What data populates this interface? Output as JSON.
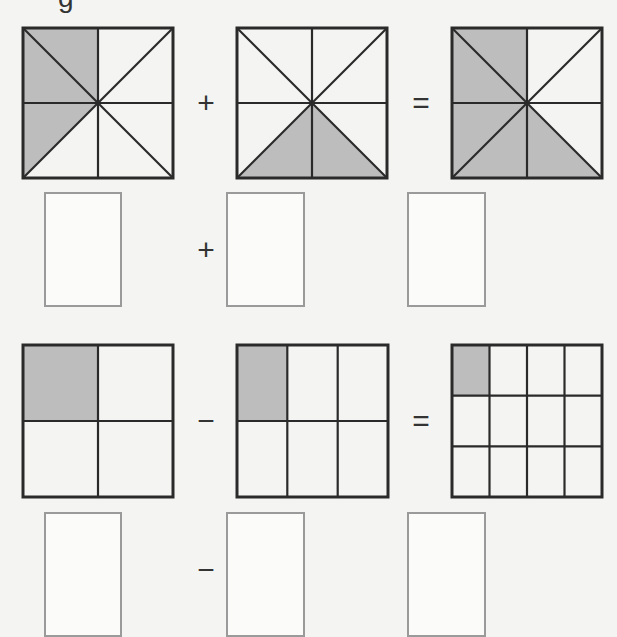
{
  "header": {
    "fragment_text": "g"
  },
  "colors": {
    "shade": "#bdbdbd",
    "line": "#2a2a2a",
    "box_border": "#9a9a9a",
    "background": "#f4f4f2"
  },
  "problems": [
    {
      "type": "addition",
      "operator": "+",
      "equals": "=",
      "figures": [
        {
          "kind": "square-eighths",
          "shaded_parts": 2,
          "total_parts": 8,
          "shaded": [
            "top-left-upper",
            "left-lower"
          ]
        },
        {
          "kind": "square-eighths",
          "shaded_parts": 2,
          "total_parts": 8,
          "shaded": [
            "bottom-left",
            "bottom-right"
          ]
        },
        {
          "kind": "square-eighths",
          "shaded_parts": 4,
          "total_parts": 8,
          "shaded": [
            "top-left-upper",
            "left-lower",
            "bottom-left",
            "bottom-right"
          ]
        }
      ],
      "answers": [
        {
          "value": "",
          "placeholder": ""
        },
        {
          "value": "",
          "placeholder": ""
        },
        {
          "value": "",
          "placeholder": ""
        }
      ]
    },
    {
      "type": "subtraction",
      "operator": "−",
      "equals": "=",
      "figures": [
        {
          "kind": "grid",
          "rows": 2,
          "cols": 2,
          "shaded_parts": 1,
          "total_parts": 4
        },
        {
          "kind": "grid",
          "rows": 2,
          "cols": 3,
          "shaded_parts": 1,
          "total_parts": 6
        },
        {
          "kind": "grid",
          "rows": 3,
          "cols": 4,
          "shaded_parts": 1,
          "total_parts": 12
        }
      ],
      "answers": [
        {
          "value": "",
          "placeholder": ""
        },
        {
          "value": "",
          "placeholder": ""
        },
        {
          "value": "",
          "placeholder": ""
        }
      ]
    }
  ]
}
